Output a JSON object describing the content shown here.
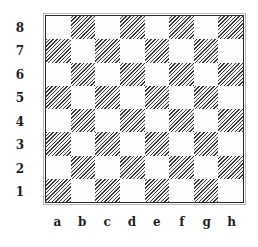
{
  "board": {
    "files": [
      "a",
      "b",
      "c",
      "d",
      "e",
      "f",
      "g",
      "h"
    ],
    "ranks": [
      "8",
      "7",
      "6",
      "5",
      "4",
      "3",
      "2",
      "1"
    ],
    "dark_square_style": "diagonal-hatch",
    "light_square_color": "#ffffff",
    "dark_square_color": "#3a3a3a",
    "border_color": "#2a2a2a",
    "bottom_left_square": "a1",
    "bottom_left_is_dark": true
  }
}
